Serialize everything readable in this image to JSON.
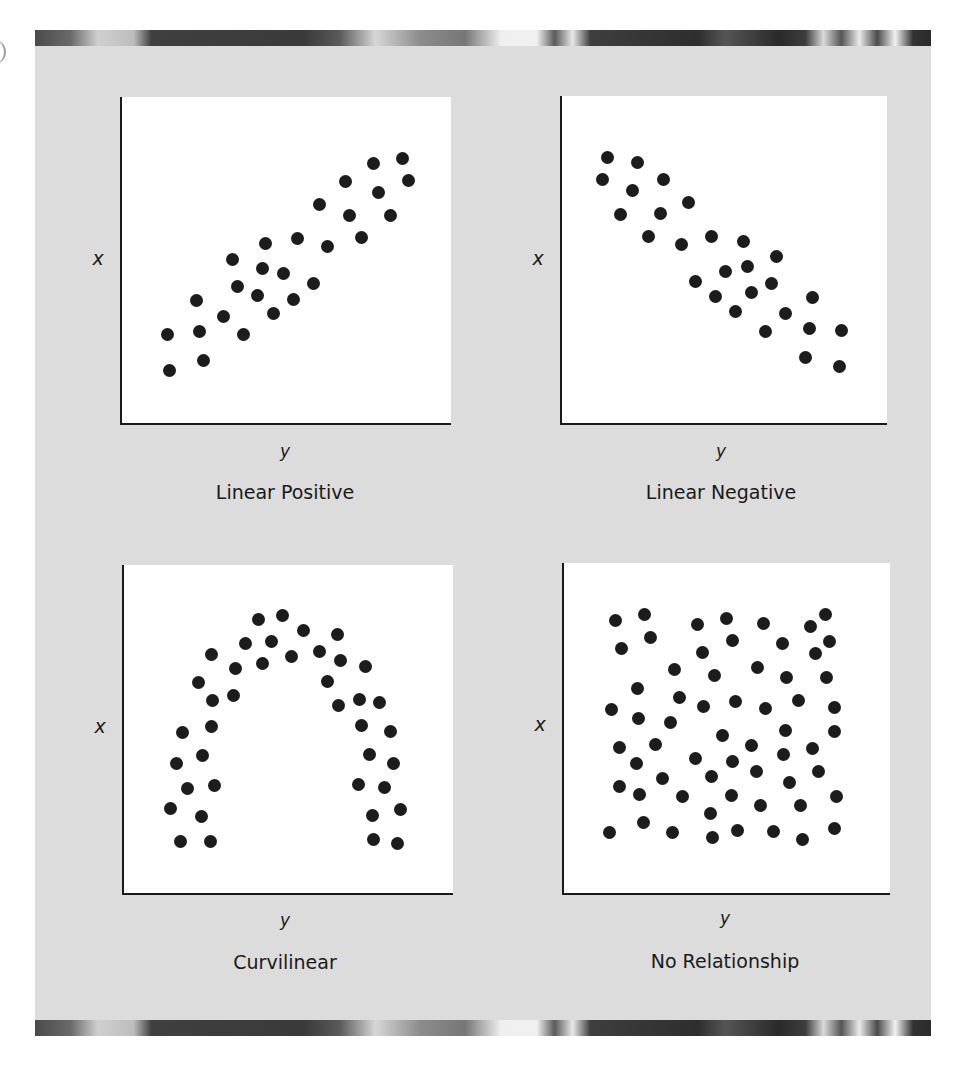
{
  "figure": {
    "background": "#dcdcdc",
    "panel_background": "#ffffff",
    "dot_color": "#1c1c1c"
  },
  "chart_data": [
    {
      "type": "scatter",
      "title": "Linear Positive",
      "xlabel": "y",
      "ylabel": "x",
      "grid": false,
      "ticks": false,
      "points_px": [
        [
          402,
          158
        ],
        [
          373,
          163
        ],
        [
          408,
          180
        ],
        [
          345,
          181
        ],
        [
          378,
          192
        ],
        [
          319,
          204
        ],
        [
          349,
          215
        ],
        [
          390,
          215
        ],
        [
          361,
          237
        ],
        [
          265,
          243
        ],
        [
          297,
          238
        ],
        [
          327,
          246
        ],
        [
          232,
          259
        ],
        [
          262,
          268
        ],
        [
          283,
          273
        ],
        [
          237,
          286
        ],
        [
          313,
          283
        ],
        [
          257,
          295
        ],
        [
          293,
          299
        ],
        [
          196,
          300
        ],
        [
          223,
          316
        ],
        [
          273,
          313
        ],
        [
          167,
          334
        ],
        [
          199,
          331
        ],
        [
          243,
          334
        ],
        [
          203,
          360
        ],
        [
          169,
          370
        ]
      ]
    },
    {
      "type": "scatter",
      "title": "Linear Negative",
      "xlabel": "y",
      "ylabel": "x",
      "grid": false,
      "ticks": false,
      "points_px": [
        [
          607,
          157
        ],
        [
          637,
          162
        ],
        [
          602,
          179
        ],
        [
          663,
          179
        ],
        [
          632,
          190
        ],
        [
          688,
          202
        ],
        [
          620,
          214
        ],
        [
          660,
          213
        ],
        [
          648,
          236
        ],
        [
          681,
          244
        ],
        [
          711,
          236
        ],
        [
          743,
          241
        ],
        [
          776,
          256
        ],
        [
          725,
          271
        ],
        [
          747,
          266
        ],
        [
          695,
          281
        ],
        [
          771,
          283
        ],
        [
          715,
          296
        ],
        [
          751,
          292
        ],
        [
          735,
          311
        ],
        [
          785,
          313
        ],
        [
          812,
          297
        ],
        [
          765,
          331
        ],
        [
          809,
          328
        ],
        [
          841,
          330
        ],
        [
          805,
          357
        ],
        [
          839,
          366
        ]
      ]
    },
    {
      "type": "scatter",
      "title": "Curvilinear",
      "xlabel": "y",
      "ylabel": "x",
      "grid": false,
      "ticks": false,
      "points_px": [
        [
          258,
          619
        ],
        [
          282,
          615
        ],
        [
          303,
          630
        ],
        [
          337,
          634
        ],
        [
          245,
          643
        ],
        [
          271,
          641
        ],
        [
          211,
          654
        ],
        [
          235,
          668
        ],
        [
          262,
          663
        ],
        [
          291,
          656
        ],
        [
          319,
          651
        ],
        [
          340,
          660
        ],
        [
          365,
          666
        ],
        [
          198,
          682
        ],
        [
          327,
          681
        ],
        [
          212,
          700
        ],
        [
          233,
          695
        ],
        [
          338,
          705
        ],
        [
          359,
          699
        ],
        [
          379,
          702
        ],
        [
          182,
          732
        ],
        [
          211,
          726
        ],
        [
          361,
          725
        ],
        [
          390,
          731
        ],
        [
          176,
          763
        ],
        [
          202,
          755
        ],
        [
          369,
          754
        ],
        [
          393,
          763
        ],
        [
          187,
          788
        ],
        [
          214,
          785
        ],
        [
          358,
          784
        ],
        [
          384,
          787
        ],
        [
          170,
          808
        ],
        [
          201,
          816
        ],
        [
          372,
          815
        ],
        [
          400,
          809
        ],
        [
          180,
          841
        ],
        [
          210,
          841
        ],
        [
          373,
          839
        ],
        [
          397,
          843
        ]
      ]
    },
    {
      "type": "scatter",
      "title": "No Relationship",
      "xlabel": "y",
      "ylabel": "x",
      "grid": false,
      "ticks": false,
      "points_px": [
        [
          615,
          620
        ],
        [
          644,
          614
        ],
        [
          697,
          624
        ],
        [
          726,
          618
        ],
        [
          763,
          623
        ],
        [
          810,
          626
        ],
        [
          825,
          614
        ],
        [
          621,
          648
        ],
        [
          650,
          637
        ],
        [
          732,
          640
        ],
        [
          782,
          643
        ],
        [
          829,
          641
        ],
        [
          702,
          652
        ],
        [
          815,
          653
        ],
        [
          674,
          669
        ],
        [
          714,
          675
        ],
        [
          757,
          667
        ],
        [
          786,
          677
        ],
        [
          826,
          677
        ],
        [
          637,
          688
        ],
        [
          679,
          697
        ],
        [
          703,
          706
        ],
        [
          735,
          701
        ],
        [
          765,
          708
        ],
        [
          798,
          700
        ],
        [
          834,
          707
        ],
        [
          611,
          709
        ],
        [
          638,
          718
        ],
        [
          670,
          722
        ],
        [
          722,
          735
        ],
        [
          785,
          730
        ],
        [
          834,
          731
        ],
        [
          619,
          747
        ],
        [
          655,
          744
        ],
        [
          751,
          745
        ],
        [
          812,
          748
        ],
        [
          636,
          763
        ],
        [
          695,
          758
        ],
        [
          732,
          761
        ],
        [
          783,
          754
        ],
        [
          756,
          771
        ],
        [
          818,
          771
        ],
        [
          662,
          778
        ],
        [
          711,
          776
        ],
        [
          789,
          782
        ],
        [
          619,
          786
        ],
        [
          639,
          794
        ],
        [
          682,
          796
        ],
        [
          731,
          795
        ],
        [
          760,
          805
        ],
        [
          800,
          805
        ],
        [
          836,
          796
        ],
        [
          710,
          813
        ],
        [
          643,
          822
        ],
        [
          609,
          832
        ],
        [
          672,
          832
        ],
        [
          712,
          837
        ],
        [
          737,
          830
        ],
        [
          773,
          831
        ],
        [
          802,
          839
        ],
        [
          834,
          828
        ]
      ]
    }
  ],
  "panels": [
    {
      "title": "Linear Positive",
      "xlabel": "y",
      "ylabel": "x",
      "box": [
        120,
        97,
        329,
        326
      ],
      "ylabel_pos": [
        98,
        258
      ],
      "xlabel_pos": [
        285,
        451
      ],
      "title_pos": [
        285,
        492
      ]
    },
    {
      "title": "Linear Negative",
      "xlabel": "y",
      "ylabel": "x",
      "box": [
        560,
        96,
        325,
        327
      ],
      "ylabel_pos": [
        538,
        258
      ],
      "xlabel_pos": [
        721,
        451
      ],
      "title_pos": [
        721,
        492
      ]
    },
    {
      "title": "Curvilinear",
      "xlabel": "y",
      "ylabel": "x",
      "box": [
        122,
        565,
        329,
        328
      ],
      "ylabel_pos": [
        100,
        726
      ],
      "xlabel_pos": [
        285,
        920
      ],
      "title_pos": [
        285,
        962
      ]
    },
    {
      "title": "No Relationship",
      "xlabel": "y",
      "ylabel": "x",
      "box": [
        562,
        563,
        326,
        330
      ],
      "ylabel_pos": [
        540,
        724
      ],
      "xlabel_pos": [
        725,
        918
      ],
      "title_pos": [
        725,
        961
      ]
    }
  ]
}
